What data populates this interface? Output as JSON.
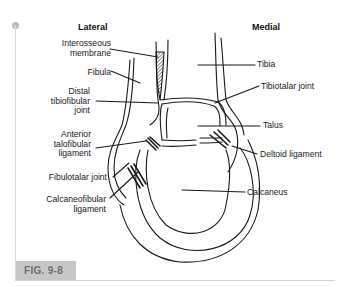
{
  "figure": {
    "label": "FIG. 9-8",
    "headers": {
      "lateral": "Lateral",
      "medial": "Medial"
    },
    "left_labels": [
      {
        "id": "interosseous",
        "lines": [
          "Interosseous",
          "membrane"
        ]
      },
      {
        "id": "fibula",
        "lines": [
          "Fibula"
        ]
      },
      {
        "id": "distal-tibiofibular",
        "lines": [
          "Distal",
          "tibiofibular",
          "joint"
        ]
      },
      {
        "id": "anterior-talofibular",
        "lines": [
          "Anterior",
          "talofibular",
          "ligament"
        ]
      },
      {
        "id": "fibulotalar",
        "lines": [
          "Fibulotalar joint"
        ]
      },
      {
        "id": "calcaneofibular",
        "lines": [
          "Calcaneofibular",
          "ligament"
        ]
      }
    ],
    "right_labels": [
      {
        "id": "tibia",
        "text": "Tibia"
      },
      {
        "id": "tibiotalar",
        "text": "Tibiotalar joint"
      },
      {
        "id": "talus",
        "text": "Talus"
      },
      {
        "id": "deltoid",
        "text": "Deltoid ligament"
      },
      {
        "id": "calcaneus",
        "text": "Calcaneus"
      }
    ]
  },
  "colors": {
    "fig_label_bg": "#c7c7c7",
    "fig_label_text": "#6f6f6f",
    "frame": "#d9d9d9",
    "ink": "#1a1a1a"
  }
}
